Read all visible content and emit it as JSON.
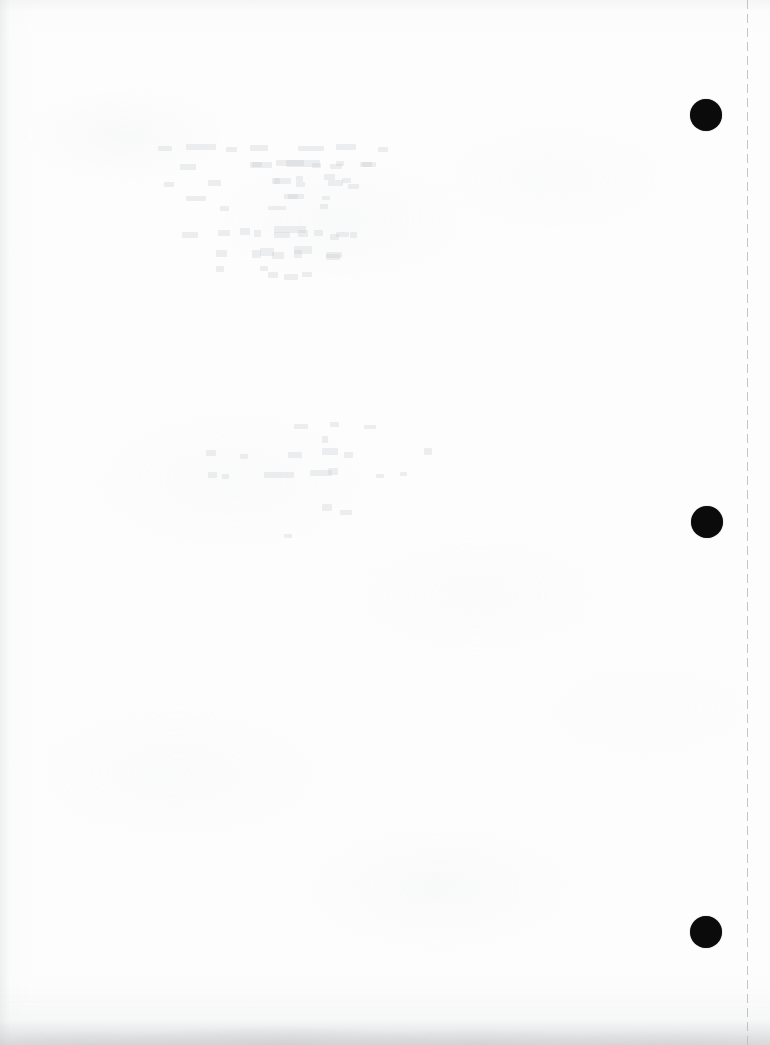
{
  "document": {
    "kind": "scanned-blank-page",
    "title": "Blank lined-paper scan",
    "page_width": 770,
    "page_height": 1045,
    "orientation": "portrait",
    "visible_text": "",
    "text_note": "No legible text is rendered anywhere on this page.",
    "paper_color": "#fdfdfd",
    "ink_color": "#0b0b0b"
  },
  "perforation": {
    "label": "tear-off perforation line",
    "style": "dashed",
    "orientation": "vertical",
    "x": 747,
    "top": 0,
    "bottom": 1045,
    "color": "#b9bcbf",
    "dash_length": 9,
    "gap_length": 5,
    "thickness": 1
  },
  "binder_holes": {
    "label": "punched binder holes",
    "count": 3,
    "color": "#0b0b0b",
    "items": [
      {
        "name": "hole-top",
        "cx": 706,
        "cy": 115,
        "diameter": 32
      },
      {
        "name": "hole-middle",
        "cx": 707,
        "cy": 522,
        "diameter": 32
      },
      {
        "name": "hole-bottom",
        "cx": 706,
        "cy": 932,
        "diameter": 32
      }
    ]
  },
  "artifacts": {
    "edge_vignette": "subtle gray shading along the left, top and bottom edges",
    "bottom_smudge": "gray mottled band along the bottom edge of the scan",
    "show_through": "very faint ghosting of writing from the reverse side of the sheet",
    "show_through_color": "#c6cace",
    "regions": [
      {
        "name": "show-through-upper-left",
        "x": 150,
        "y": 140,
        "width": 260,
        "height": 150
      },
      {
        "name": "show-through-upper-mid",
        "x": 250,
        "y": 160,
        "width": 130,
        "height": 130
      },
      {
        "name": "show-through-middle",
        "x": 200,
        "y": 420,
        "width": 260,
        "height": 120
      }
    ]
  }
}
